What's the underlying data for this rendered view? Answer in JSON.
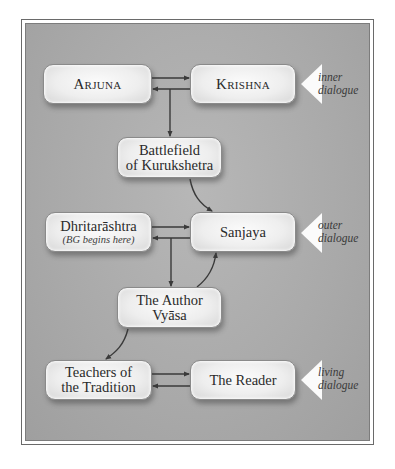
{
  "diagram": {
    "nodes": {
      "arjuna": "Arjuna",
      "krishna": "Krishna",
      "battlefield": [
        "Battlefield",
        "of Kurukshetra"
      ],
      "dhritarashtra": "Dhritarāshtra",
      "dhritarashtra_note": "(BG begins here)",
      "sanjaya": "Sanjaya",
      "author": [
        "The Author",
        "Vyāsa"
      ],
      "teachers": [
        "Teachers of",
        "the Tradition"
      ],
      "reader": "The Reader"
    },
    "dialogue_labels": {
      "inner": [
        "inner",
        "dialogue"
      ],
      "outer": [
        "outer",
        "dialogue"
      ],
      "living": [
        "living",
        "dialogue"
      ]
    },
    "edges": [
      {
        "from": "arjuna",
        "to": "krishna"
      },
      {
        "from": "krishna",
        "to": "arjuna"
      },
      {
        "from": "arjuna-krishna",
        "to": "battlefield"
      },
      {
        "from": "battlefield",
        "to": "sanjaya"
      },
      {
        "from": "dhritarashtra",
        "to": "sanjaya"
      },
      {
        "from": "sanjaya",
        "to": "dhritarashtra"
      },
      {
        "from": "dhritarashtra-sanjaya",
        "to": "author"
      },
      {
        "from": "author",
        "to": "sanjaya"
      },
      {
        "from": "author",
        "to": "teachers"
      },
      {
        "from": "teachers",
        "to": "reader"
      },
      {
        "from": "reader",
        "to": "teachers"
      }
    ]
  }
}
